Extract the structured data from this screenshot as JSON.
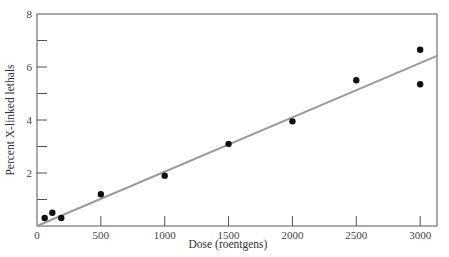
{
  "chart_data": {
    "type": "scatter",
    "title": "",
    "xlabel": "Dose (roentgens)",
    "ylabel": "Percent X-linked lethals",
    "xlim": [
      0,
      3132
    ],
    "ylim": [
      0,
      8
    ],
    "x_ticks": [
      0,
      500,
      1000,
      1500,
      2000,
      2500,
      3000
    ],
    "x_tick_labels": [
      "0",
      "500",
      "1000",
      "1500",
      "2000",
      "2500",
      "3000"
    ],
    "y_ticks_major": [
      2,
      4,
      6,
      8
    ],
    "y_tick_labels": [
      "2",
      "4",
      "6",
      "8"
    ],
    "y_ticks_minor": [
      1,
      3,
      5,
      7
    ],
    "grid": false,
    "legend": null,
    "series": [
      {
        "name": "Observed",
        "type": "scatter",
        "color": "#111111",
        "points": [
          {
            "x": 60,
            "y": 0.3
          },
          {
            "x": 120,
            "y": 0.5
          },
          {
            "x": 190,
            "y": 0.3
          },
          {
            "x": 500,
            "y": 1.2
          },
          {
            "x": 1000,
            "y": 1.9
          },
          {
            "x": 1500,
            "y": 3.1
          },
          {
            "x": 2000,
            "y": 3.95
          },
          {
            "x": 2500,
            "y": 5.5
          },
          {
            "x": 3000,
            "y": 6.65
          },
          {
            "x": 3000,
            "y": 5.35
          }
        ]
      },
      {
        "name": "Linear fit",
        "type": "line",
        "color": "#9a9a9a",
        "points": [
          {
            "x": 0,
            "y": 0
          },
          {
            "x": 3132,
            "y": 6.42
          }
        ]
      }
    ]
  },
  "labels": {
    "x_axis_title": "Dose (roentgens)",
    "y_axis_title": "Percent X-linked lethals"
  }
}
